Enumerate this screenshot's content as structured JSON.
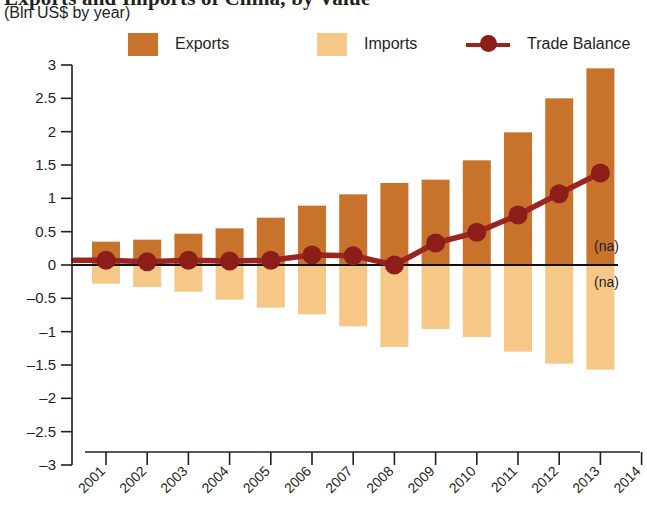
{
  "header": {
    "title": "Exports and Imports of China, by Value",
    "subtitle": "(Bln US$ by year)"
  },
  "legend": {
    "position": "top",
    "items": [
      {
        "label": "Exports",
        "marker": "square-swatch",
        "color": "#C8732C"
      },
      {
        "label": "Imports",
        "marker": "square-swatch",
        "color": "#F5C888"
      },
      {
        "label": "Trade Balance",
        "marker": "line-with-dot",
        "color": "#9B2420"
      }
    ]
  },
  "annotations": {
    "na_upper": "(na)",
    "na_lower": "(na)"
  },
  "colors": {
    "exports": "#C8732C",
    "imports": "#F5C888",
    "balance": "#9B2420",
    "axis": "#231f1c",
    "background": "#ffffff"
  },
  "chart_data": {
    "type": "bar",
    "title": "Exports and Imports of China, by Value",
    "subtitle": "(Bln US$ by year)",
    "xlabel": "",
    "ylabel": "Bln US$ by year",
    "ylim": [
      -3,
      3
    ],
    "yticks": [
      3,
      2.5,
      2,
      1.5,
      1,
      0.5,
      0,
      -0.5,
      -1,
      -1.5,
      -2,
      -2.5,
      -3
    ],
    "ytick_labels": [
      "3",
      "2.5",
      "2",
      "1.5",
      "1",
      "0.5",
      "0",
      "-0.5",
      "-1",
      "-1.5",
      "-2",
      "-2.5",
      "-3"
    ],
    "categories": [
      "2001",
      "2002",
      "2003",
      "2004",
      "2005",
      "2006",
      "2007",
      "2008",
      "2009",
      "2010",
      "2011",
      "2012",
      "2013"
    ],
    "xtick_labels": [
      "2001",
      "2002",
      "2003",
      "2004",
      "2005",
      "2006",
      "2007",
      "2008",
      "2009",
      "2010",
      "2011",
      "2012",
      "2014"
    ],
    "xaxis_ticks": [
      "2001",
      "2002",
      "2003",
      "2004",
      "2005",
      "2006",
      "2007",
      "2008",
      "2009",
      "2010",
      "2011",
      "2012",
      "2013",
      "2014"
    ],
    "grid": false,
    "legend_position": "top",
    "series": [
      {
        "name": "Exports",
        "type": "bar",
        "color": "#C8732C",
        "values": [
          0.35,
          0.38,
          0.47,
          0.55,
          0.71,
          0.89,
          1.06,
          1.23,
          1.28,
          1.57,
          1.99,
          2.5,
          2.95
        ]
      },
      {
        "name": "Imports",
        "type": "bar",
        "color": "#F5C888",
        "values": [
          -0.28,
          -0.33,
          -0.4,
          -0.52,
          -0.64,
          -0.74,
          -0.92,
          -1.23,
          -0.96,
          -1.08,
          -1.3,
          -1.48,
          -1.57
        ]
      },
      {
        "name": "Trade Balance",
        "type": "line",
        "color": "#9B2420",
        "values": [
          0.07,
          0.05,
          0.07,
          0.06,
          0.07,
          0.15,
          0.14,
          0.0,
          0.33,
          0.49,
          0.75,
          1.07,
          1.38
        ]
      }
    ]
  }
}
